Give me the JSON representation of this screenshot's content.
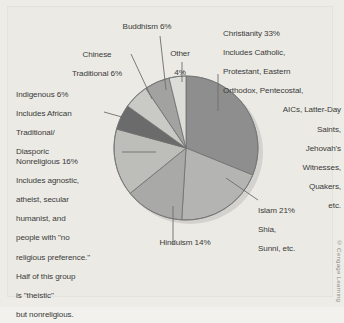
{
  "figure": {
    "background_color": "#edece7",
    "credit": "© Cengage Learning"
  },
  "chart_data": {
    "type": "pie",
    "title": "",
    "xlabel": "",
    "ylabel": "",
    "units": "percent",
    "start_angle_deg": 0,
    "direction": "clockwise",
    "legend": "none",
    "grid": false,
    "categories": [
      "Christianity",
      "Islam",
      "Hinduism",
      "Nonreligious",
      "Indigenous",
      "Chinese Traditional",
      "Buddhism",
      "Other"
    ],
    "values": [
      33,
      21,
      14,
      16,
      6,
      6,
      6,
      4
    ],
    "colors": [
      "#8e8e8e",
      "#b4b4b2",
      "#a9a9a7",
      "#bdbdba",
      "#6b6b6b",
      "#c9c9c6",
      "#a2a2a0",
      "#dcdcd8"
    ],
    "slices": [
      {
        "label": "Christianity",
        "value": 33,
        "color": "#8e8e8e"
      },
      {
        "label": "Islam",
        "value": 21,
        "color": "#b4b4b2"
      },
      {
        "label": "Hinduism",
        "value": 14,
        "color": "#a9a9a7"
      },
      {
        "label": "Nonreligious",
        "value": 16,
        "color": "#bdbdba"
      },
      {
        "label": "Indigenous",
        "value": 6,
        "color": "#6b6b6b"
      },
      {
        "label": "Chinese Traditional",
        "value": 6,
        "color": "#c9c9c6"
      },
      {
        "label": "Buddhism",
        "value": 6,
        "color": "#a2a2a0"
      },
      {
        "label": "Other",
        "value": 4,
        "color": "#dcdcd8"
      }
    ],
    "annotations": [
      "Christianity 33% Includes Catholic, Protestant, Eastern Orthodox, Pentecostal, AICs, Latter-Day Saints, Jehovah's Witnesses, Quakers, etc.",
      "Islam 21% Shia, Sunni, etc.",
      "Hinduism 14%",
      "Nonreligious 16% Includes agnostic, atheist, secular humanist, and people with \"no religious preference.\" Half of this group is \"theistic\" but nonreligious.",
      "Indigenous 6% Includes African Traditional/Diasporic",
      "Chinese Traditional 6%",
      "Buddhism 6%",
      "Other 4%"
    ]
  },
  "labels": {
    "christianity": {
      "l1": "Christianity 33%",
      "l2": "Includes Catholic,",
      "l3": "Protestant, Eastern",
      "l4": "Orthodox, Pentecostal,",
      "l5": "AICs, Latter-Day",
      "l6": "Saints,",
      "l7": "Jehovah's",
      "l8": "Witnesses,",
      "l9": "Quakers,",
      "l10": "etc."
    },
    "buddhism": "Buddhism 6%",
    "other": {
      "l1": "Other",
      "l2": "4%"
    },
    "chinese": {
      "l1": "Chinese",
      "l2": "Traditional 6%"
    },
    "indigenous": {
      "l1": "Indigenous 6%",
      "l2": "Includes African",
      "l3": "Traditional/",
      "l4": "Diasporic"
    },
    "nonreligious": {
      "l1": "Nonreligious 16%",
      "l2": "Includes agnostic,",
      "l3": "atheist, secular",
      "l4": "humanist, and",
      "l5": "people with \"no",
      "l6": "religious preference.\"",
      "l7": "Half of this group",
      "l8": "is \"theistic\"",
      "l9": "but nonreligious."
    },
    "hinduism": "Hinduism 14%",
    "islam": {
      "l1": "Islam 21%",
      "l2": "Shia,",
      "l3": "Sunni, etc."
    }
  }
}
